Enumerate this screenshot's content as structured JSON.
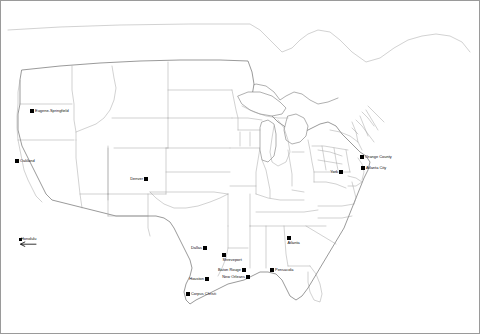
{
  "map": {
    "title": "United States city markers map",
    "background_color": "#ffffff",
    "border_color": "#9a9a9a",
    "outline_color": "#8d8d8d",
    "marker_color": "#000000",
    "label_color": "#0c0c0c",
    "projection_note": "contiguous United States with state and county boundaries"
  },
  "cities": [
    {
      "name": "Eugene-Springfield",
      "x": 32,
      "y": 111,
      "label_side": "right"
    },
    {
      "name": "Oakland",
      "x": 17,
      "y": 161,
      "label_side": "right"
    },
    {
      "name": "Denver",
      "x": 146,
      "y": 179,
      "label_side": "left"
    },
    {
      "name": "Dallas",
      "x": 205,
      "y": 248,
      "label_side": "left"
    },
    {
      "name": "Shreveport",
      "x": 224,
      "y": 255,
      "label_side": "below"
    },
    {
      "name": "Houston",
      "x": 207,
      "y": 279,
      "label_side": "left"
    },
    {
      "name": "Baton Rouge",
      "x": 244,
      "y": 270,
      "label_side": "left"
    },
    {
      "name": "New Orleans",
      "x": 248,
      "y": 277,
      "label_side": "left"
    },
    {
      "name": "Corpus Christi",
      "x": 188,
      "y": 294,
      "label_side": "right"
    },
    {
      "name": "Pensacola",
      "x": 272,
      "y": 270,
      "label_side": "right"
    },
    {
      "name": "Atlanta",
      "x": 289,
      "y": 238,
      "label_side": "below"
    },
    {
      "name": "Atlanta City",
      "x": 363,
      "y": 168,
      "label_side": "right"
    },
    {
      "name": "Orange County",
      "x": 362,
      "y": 157,
      "label_side": "right"
    },
    {
      "name": "York",
      "x": 341,
      "y": 172,
      "label_side": "left"
    }
  ],
  "off_map_cities": [
    {
      "name": "Honolulu",
      "x": 14,
      "y": 244,
      "arrow_direction": "left"
    }
  ]
}
